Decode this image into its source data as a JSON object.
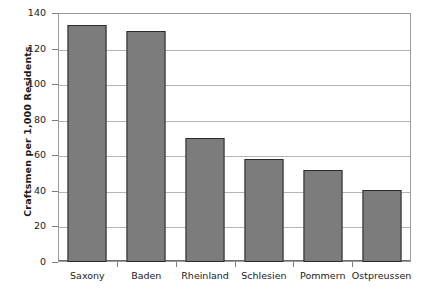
{
  "chart_data": {
    "type": "bar",
    "title": "",
    "xlabel": "",
    "ylabel": "Craftsmen per 1,000 Residents",
    "categories": [
      "Saxony",
      "Baden",
      "Rheinland",
      "Schlesien",
      "Pommern",
      "Ostpreussen"
    ],
    "values": [
      133,
      130,
      70,
      58,
      52,
      40.5
    ],
    "ylim": [
      0,
      140
    ],
    "yticks": [
      0,
      20,
      40,
      60,
      80,
      100,
      120,
      140
    ],
    "ytick_labels": [
      "0",
      "20",
      "40",
      "60",
      "80",
      "100",
      "120",
      "140"
    ],
    "grid": "horizontal",
    "legend": "none",
    "colors": {
      "bar_fill": "#7c7c7c",
      "bar_outline": "#2b2b2b",
      "gridline": "#b4b4b4",
      "axis": "#6e6e6e",
      "background": "#ffffff",
      "text": "#1a1a1a"
    }
  }
}
